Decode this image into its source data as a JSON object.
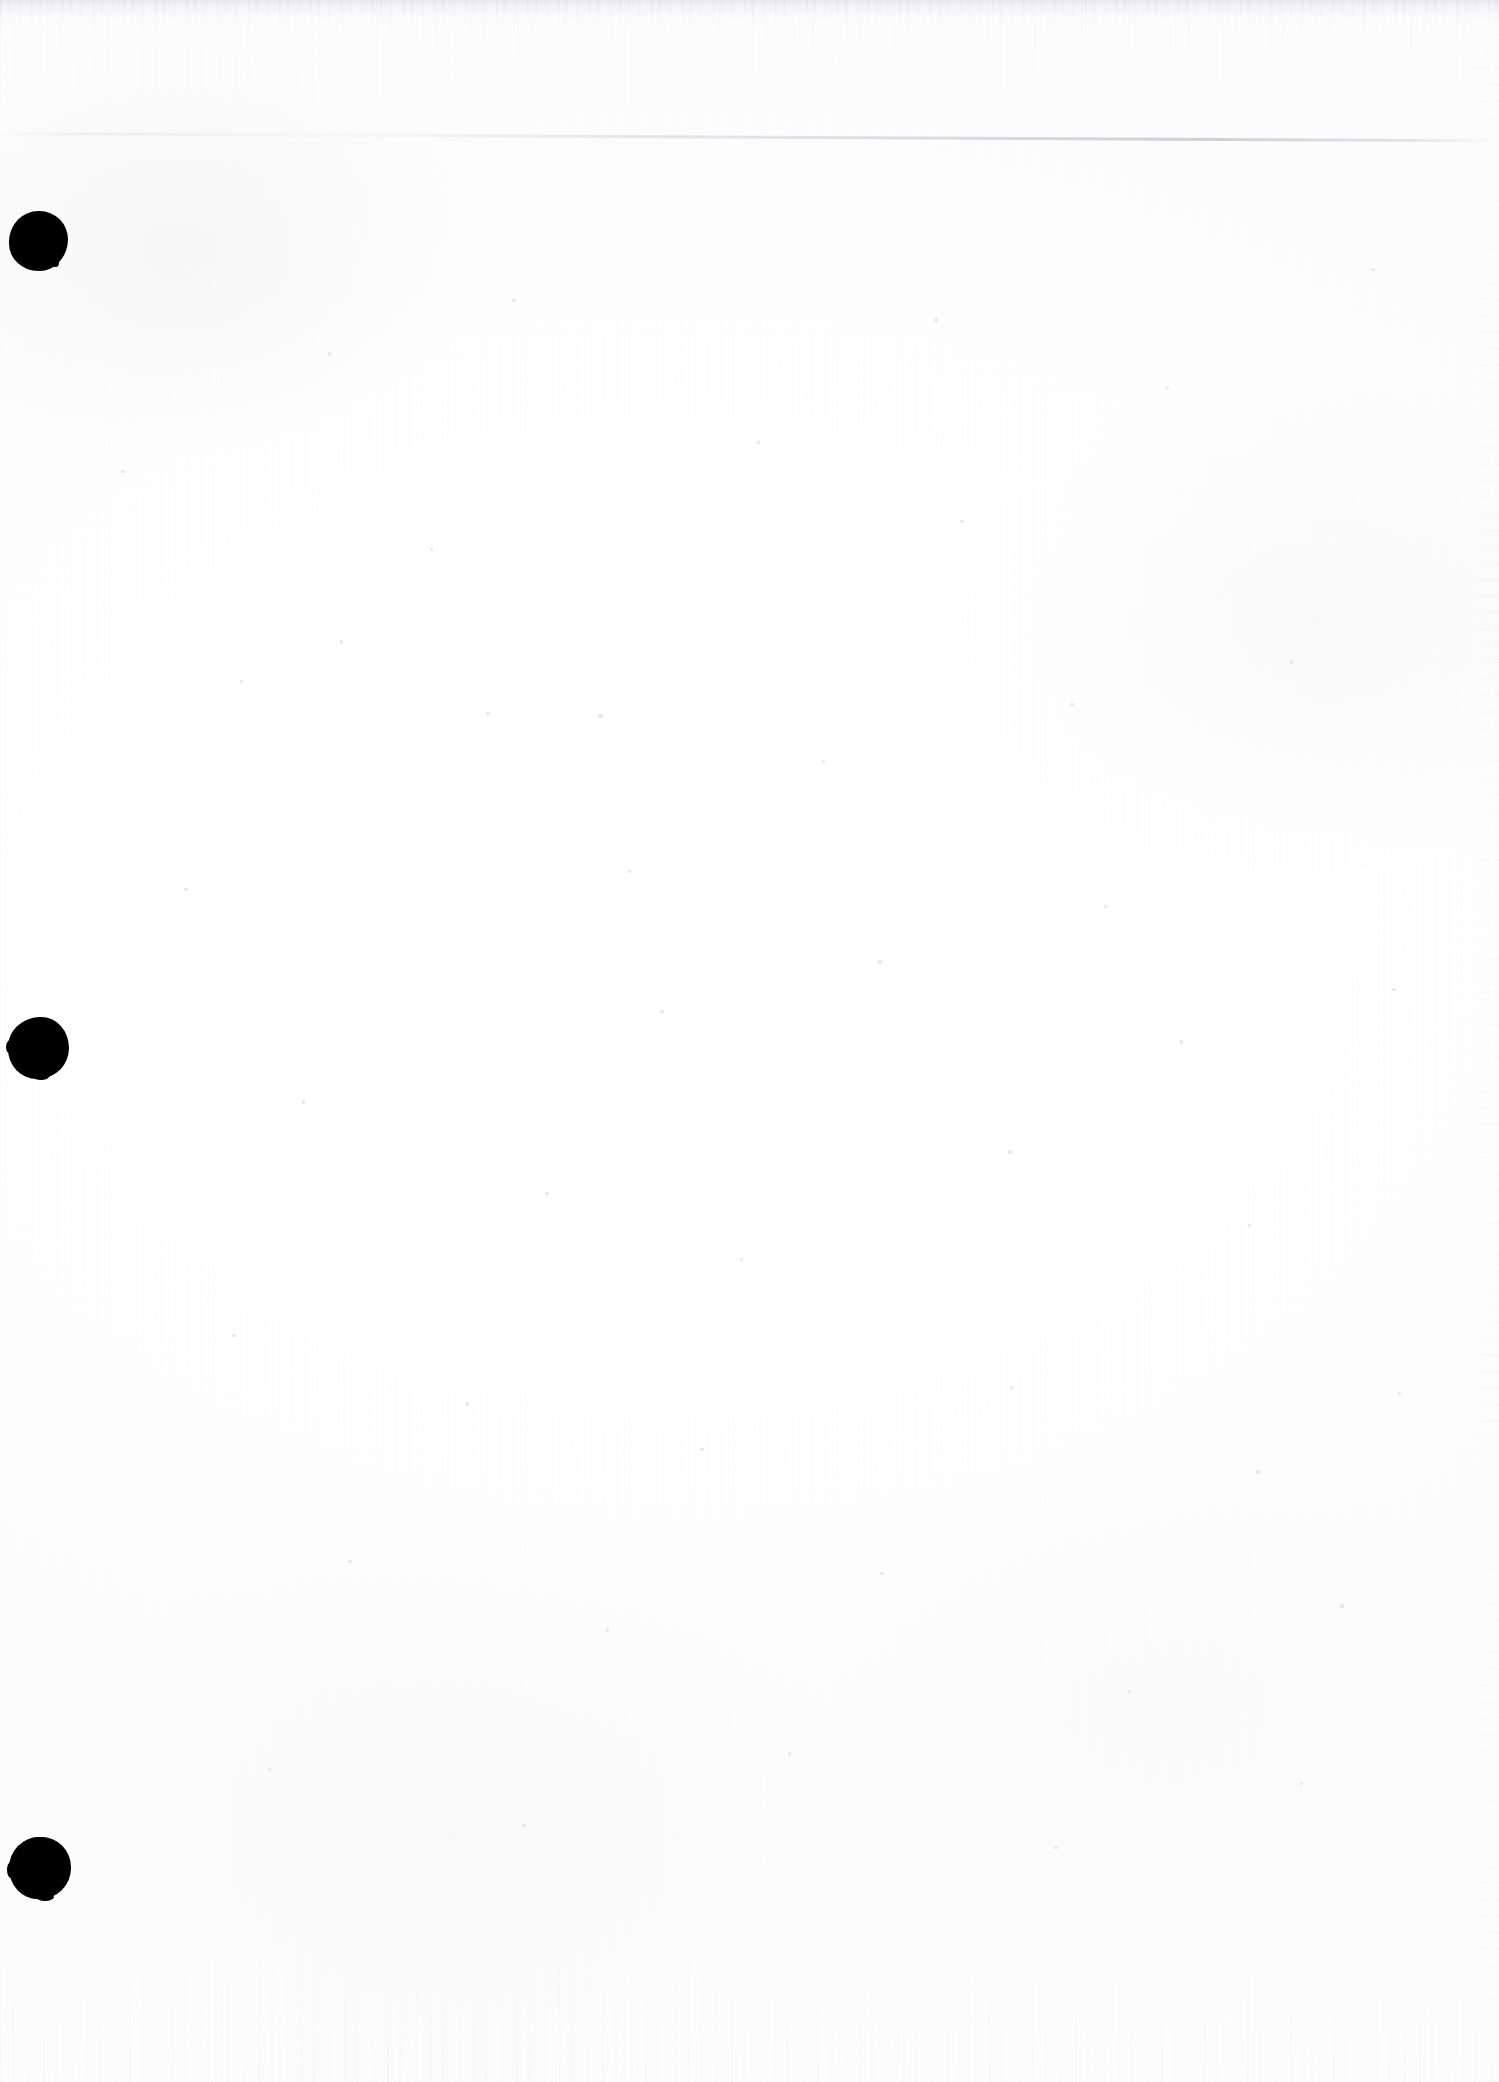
{
  "document": {
    "kind": "scanned-page",
    "title": "Scanned blank page",
    "page_state": "blank",
    "orientation": "portrait",
    "visible_text": "",
    "page_width_px": 1499,
    "page_height_px": 2082
  },
  "colors": {
    "paper": "#ffffff",
    "paper_tint": "#fdfdfd",
    "punch_hole": "#000000",
    "scanner_edge_grey": "#e4e4e7",
    "sheet_edge_line": "#c4c4ce",
    "speck_grey": "#d6d6dc"
  },
  "artifacts": {
    "top_edge_band": {
      "name": "scanner-top-edge-band",
      "description": "Streaky grey band along the top border of the scan",
      "y_px": 0,
      "height_px": 26
    },
    "top_streaks": {
      "name": "scanner-top-streaks",
      "description": "Faint vertical drip streaks descending from the top edge",
      "y_px": 0,
      "height_px": 120
    },
    "bottom_edge_band": {
      "name": "scanner-bottom-edge-band",
      "description": "Streaky grey band along the bottom border of the scan",
      "height_px": 130
    },
    "right_edge_band": {
      "name": "scanner-right-edge-band",
      "description": "Faint vertical grey streak along the right border",
      "width_px": 30
    },
    "sheet_edge_line": {
      "name": "underlying-sheet-edge-line",
      "description": "Faint near-horizontal line of an underlying sheet edge crossing the upper page",
      "y_px": 132,
      "angle_deg": 0.28
    }
  },
  "punch_holes": {
    "count": 3,
    "alignment": "left-margin",
    "items": [
      {
        "label": "punch-hole-top",
        "center_x_px": 39,
        "center_y_px": 240,
        "diameter_px": 58
      },
      {
        "label": "punch-hole-middle",
        "center_x_px": 39,
        "center_y_px": 1048,
        "diameter_px": 60
      },
      {
        "label": "punch-hole-bottom",
        "center_x_px": 41,
        "center_y_px": 1868,
        "diameter_px": 61
      }
    ]
  },
  "specks": [
    {
      "x": 121,
      "y": 470,
      "w": 4,
      "h": 3
    },
    {
      "x": 328,
      "y": 352,
      "w": 3,
      "h": 4
    },
    {
      "x": 512,
      "y": 299,
      "w": 4,
      "h": 3
    },
    {
      "x": 757,
      "y": 441,
      "w": 3,
      "h": 3
    },
    {
      "x": 934,
      "y": 318,
      "w": 4,
      "h": 4
    },
    {
      "x": 1166,
      "y": 386,
      "w": 3,
      "h": 3
    },
    {
      "x": 1371,
      "y": 268,
      "w": 4,
      "h": 3
    },
    {
      "x": 340,
      "y": 640,
      "w": 3,
      "h": 4
    },
    {
      "x": 486,
      "y": 712,
      "w": 4,
      "h": 3
    },
    {
      "x": 598,
      "y": 714,
      "w": 5,
      "h": 4
    },
    {
      "x": 822,
      "y": 760,
      "w": 3,
      "h": 3
    },
    {
      "x": 1070,
      "y": 703,
      "w": 4,
      "h": 3
    },
    {
      "x": 1290,
      "y": 660,
      "w": 3,
      "h": 4
    },
    {
      "x": 184,
      "y": 888,
      "w": 4,
      "h": 3
    },
    {
      "x": 628,
      "y": 870,
      "w": 3,
      "h": 3
    },
    {
      "x": 878,
      "y": 960,
      "w": 4,
      "h": 4
    },
    {
      "x": 1104,
      "y": 905,
      "w": 3,
      "h": 3
    },
    {
      "x": 1392,
      "y": 988,
      "w": 4,
      "h": 3
    },
    {
      "x": 302,
      "y": 1100,
      "w": 3,
      "h": 4
    },
    {
      "x": 545,
      "y": 1192,
      "w": 4,
      "h": 3
    },
    {
      "x": 740,
      "y": 1258,
      "w": 3,
      "h": 3
    },
    {
      "x": 1008,
      "y": 1150,
      "w": 4,
      "h": 4
    },
    {
      "x": 1248,
      "y": 1224,
      "w": 3,
      "h": 3
    },
    {
      "x": 232,
      "y": 1334,
      "w": 4,
      "h": 3
    },
    {
      "x": 466,
      "y": 1402,
      "w": 3,
      "h": 4
    },
    {
      "x": 700,
      "y": 1448,
      "w": 4,
      "h": 3
    },
    {
      "x": 1010,
      "y": 1386,
      "w": 3,
      "h": 3
    },
    {
      "x": 1256,
      "y": 1470,
      "w": 4,
      "h": 4
    },
    {
      "x": 1398,
      "y": 1392,
      "w": 3,
      "h": 3
    },
    {
      "x": 348,
      "y": 1560,
      "w": 4,
      "h": 3
    },
    {
      "x": 606,
      "y": 1628,
      "w": 3,
      "h": 4
    },
    {
      "x": 880,
      "y": 1572,
      "w": 4,
      "h": 3
    },
    {
      "x": 1128,
      "y": 1690,
      "w": 3,
      "h": 3
    },
    {
      "x": 1340,
      "y": 1604,
      "w": 4,
      "h": 4
    },
    {
      "x": 268,
      "y": 1768,
      "w": 3,
      "h": 3
    },
    {
      "x": 522,
      "y": 1824,
      "w": 4,
      "h": 3
    },
    {
      "x": 788,
      "y": 1752,
      "w": 3,
      "h": 4
    },
    {
      "x": 1054,
      "y": 1846,
      "w": 4,
      "h": 3
    },
    {
      "x": 1300,
      "y": 1782,
      "w": 3,
      "h": 3
    },
    {
      "x": 430,
      "y": 548,
      "w": 3,
      "h": 3
    },
    {
      "x": 960,
      "y": 520,
      "w": 4,
      "h": 3
    },
    {
      "x": 1180,
      "y": 1040,
      "w": 3,
      "h": 4
    },
    {
      "x": 660,
      "y": 1010,
      "w": 4,
      "h": 3
    },
    {
      "x": 240,
      "y": 680,
      "w": 3,
      "h": 3
    }
  ]
}
